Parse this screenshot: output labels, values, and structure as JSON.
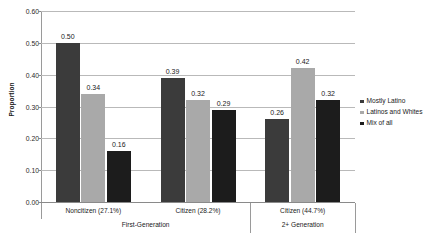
{
  "chart_data": {
    "type": "bar",
    "title": "",
    "xlabel": "",
    "ylabel": "Proportion",
    "ylim": [
      0.0,
      0.6
    ],
    "ytick_labels": [
      "0.60",
      "0.50",
      "0.40",
      "0.30",
      "0.20",
      "0.10",
      "0.00"
    ],
    "ytick_values": [
      0.6,
      0.5,
      0.4,
      0.3,
      0.2,
      0.1,
      0.0
    ],
    "grid": true,
    "legend_position": "right",
    "categories": [
      "Noncitizen (27.1%)",
      "Citizen (28.2%)",
      "Citizen (44.7%)"
    ],
    "groups": [
      {
        "label": "First-Generation",
        "categories": [
          "Noncitizen (27.1%)",
          "Citizen (28.2%)"
        ]
      },
      {
        "label": "2+ Generation",
        "categories": [
          "Citizen (44.7%)"
        ]
      }
    ],
    "series": [
      {
        "name": "Mostly Latino",
        "color": "#3b3b3b",
        "values": [
          0.5,
          0.39,
          0.26
        ],
        "labels": [
          "0.50",
          "0.39",
          "0.26"
        ]
      },
      {
        "name": "Latinos and Whites",
        "color": "#a9a9a9",
        "values": [
          0.34,
          0.32,
          0.42
        ],
        "labels": [
          "0.34",
          "0.32",
          "0.42"
        ]
      },
      {
        "name": "Mix of all",
        "color": "#1c1c1c",
        "values": [
          0.16,
          0.29,
          0.32
        ],
        "labels": [
          "0.16",
          "0.29",
          "0.32"
        ]
      }
    ]
  }
}
